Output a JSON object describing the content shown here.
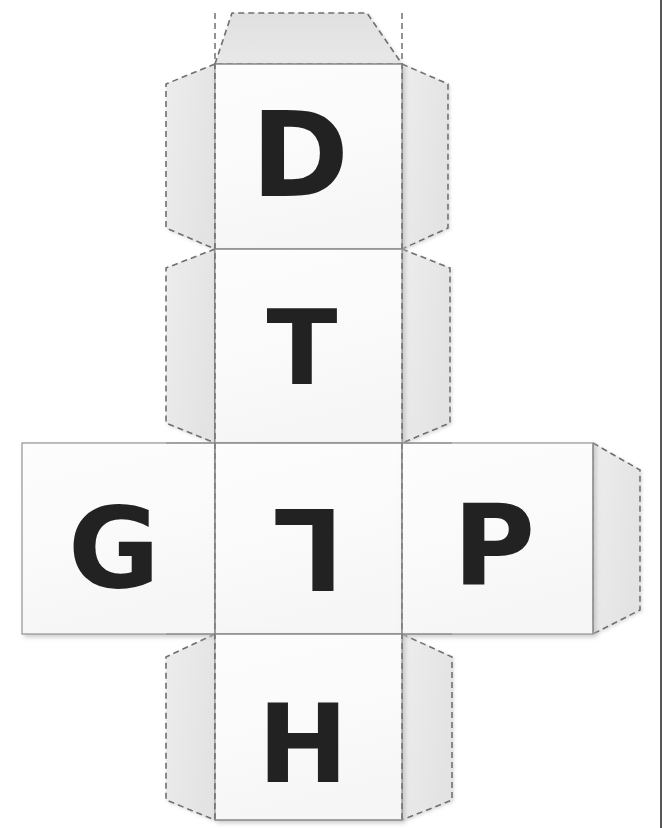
{
  "document": {
    "title": "Printable Cube Net Template",
    "type": "paper-craft-cutout",
    "background_color": "#ffffff"
  },
  "style": {
    "panel_fill": "#fcfcfc",
    "flap_fill": "#eaeaea",
    "flap_fill_alt": "#e4e4e4",
    "top_flap_fill": "#e2e2e2",
    "solid_line_color": "#8a8a8a",
    "dashed_line_color": "#707070",
    "letter_color": "#222222",
    "shadow_color": "#c9c9c9",
    "edge_bar_color": "#3a3a3a"
  },
  "net": {
    "panel_size": 188,
    "columns_x": [
      22,
      215,
      402,
      593
    ],
    "rows_y": [
      64,
      249,
      443,
      634,
      820
    ],
    "fold_line_style": "dashed",
    "cut_line_style": "solid"
  },
  "panels": [
    {
      "id": "panel-top",
      "name": "panel-d",
      "letter": "D",
      "row": 1,
      "column": "center",
      "x": 215,
      "y": 64,
      "width": 187,
      "height": 185,
      "letter_rotation": 0,
      "letter_x": 300,
      "letter_y": 155,
      "letter_size": 118
    },
    {
      "id": "panel-second",
      "name": "panel-t",
      "letter": "T",
      "row": 2,
      "column": "center",
      "x": 215,
      "y": 249,
      "width": 187,
      "height": 194,
      "letter_rotation": 0,
      "letter_x": 302,
      "letter_y": 348,
      "letter_size": 104
    },
    {
      "id": "panel-left",
      "name": "panel-g",
      "letter": "G",
      "row": 3,
      "column": "left",
      "x": 22,
      "y": 443,
      "width": 193,
      "height": 191,
      "letter_rotation": 0,
      "letter_x": 114,
      "letter_y": 548,
      "letter_size": 112
    },
    {
      "id": "panel-center",
      "name": "panel-l",
      "letter": "L",
      "row": 3,
      "column": "center",
      "x": 215,
      "y": 443,
      "width": 187,
      "height": 191,
      "letter_rotation": 180,
      "letter_x": 308,
      "letter_y": 548,
      "letter_size": 112
    },
    {
      "id": "panel-right",
      "name": "panel-p",
      "letter": "P",
      "row": 3,
      "column": "right",
      "x": 402,
      "y": 443,
      "width": 191,
      "height": 191,
      "letter_rotation": 0,
      "letter_x": 494,
      "letter_y": 545,
      "letter_size": 112
    },
    {
      "id": "panel-bottom",
      "name": "panel-h",
      "letter": "H",
      "row": 4,
      "column": "center",
      "x": 215,
      "y": 634,
      "width": 187,
      "height": 186,
      "letter_rotation": 0,
      "letter_x": 303,
      "letter_y": 744,
      "letter_size": 108
    }
  ],
  "flaps": [
    {
      "id": "flap-top",
      "name": "glue-flap-top",
      "shape": "trapezoid",
      "position": "above-panel-d",
      "fill": "#e2e2e2"
    },
    {
      "id": "flap-d-left",
      "name": "glue-flap-d-left",
      "shape": "hexagon",
      "position": "left-of-panel-d",
      "fill": "#eaeaea"
    },
    {
      "id": "flap-d-right",
      "name": "glue-flap-d-right",
      "shape": "hexagon",
      "position": "right-of-panel-d",
      "fill": "#eaeaea"
    },
    {
      "id": "flap-t-left",
      "name": "glue-flap-t-left",
      "shape": "hexagon",
      "position": "left-of-panel-t",
      "fill": "#eaeaea"
    },
    {
      "id": "flap-t-right",
      "name": "glue-flap-t-right",
      "shape": "hexagon",
      "position": "right-of-panel-t",
      "fill": "#eaeaea"
    },
    {
      "id": "flap-h-left",
      "name": "glue-flap-h-left",
      "shape": "hexagon",
      "position": "left-of-panel-h",
      "fill": "#eaeaea"
    },
    {
      "id": "flap-h-right",
      "name": "glue-flap-h-right",
      "shape": "hexagon",
      "position": "right-of-panel-h",
      "fill": "#eaeaea"
    },
    {
      "id": "flap-p-right",
      "name": "glue-flap-p-right",
      "shape": "hexagon",
      "position": "right-of-panel-p",
      "fill": "#e4e4e4"
    }
  ],
  "letters_in_order": [
    "D",
    "T",
    "G",
    "L",
    "P",
    "H"
  ]
}
